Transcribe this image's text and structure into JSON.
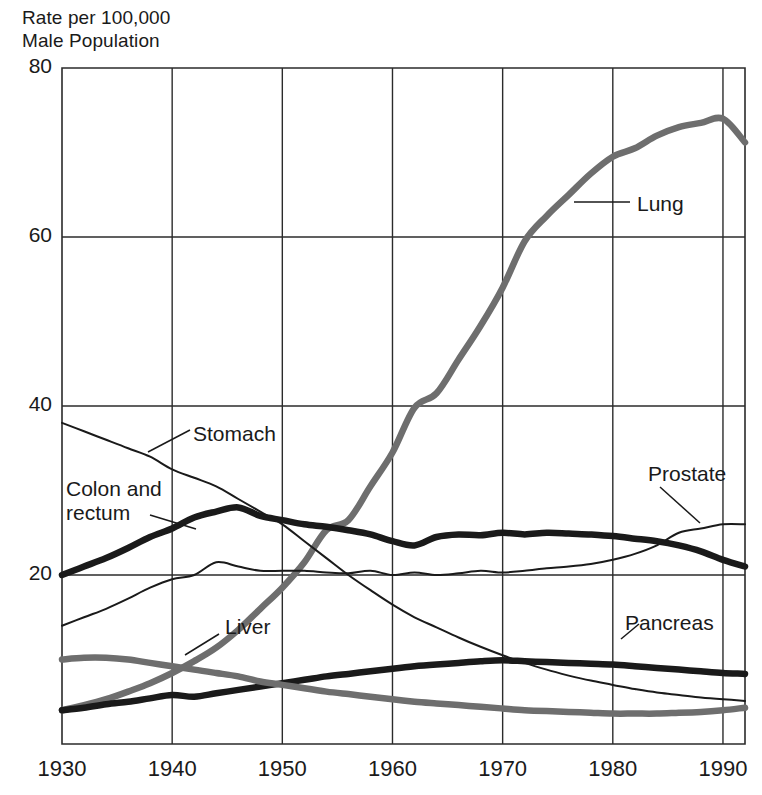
{
  "chart_data": {
    "type": "line",
    "title": "",
    "ylabel": "Rate per 100,000\nMale Population",
    "xlabel": "",
    "xlim": [
      1930,
      1992
    ],
    "ylim": [
      0,
      80
    ],
    "grid": true,
    "legend_position": "inline-labels",
    "yticks": [
      "80",
      "60",
      "40",
      "20"
    ],
    "ytick_values": [
      80,
      60,
      40,
      20
    ],
    "xticks": [
      "1930",
      "1940",
      "1950",
      "1960",
      "1970",
      "1980",
      "1990"
    ],
    "xtick_values": [
      1930,
      1940,
      1950,
      1960,
      1970,
      1980,
      1990
    ],
    "x": [
      1930,
      1932,
      1934,
      1936,
      1938,
      1940,
      1942,
      1944,
      1946,
      1948,
      1950,
      1952,
      1954,
      1956,
      1958,
      1960,
      1962,
      1964,
      1966,
      1968,
      1970,
      1972,
      1974,
      1976,
      1978,
      1980,
      1982,
      1984,
      1986,
      1988,
      1990,
      1992
    ],
    "series": [
      {
        "name": "Lung",
        "color": "#6e6e6e",
        "width": "thick",
        "label": "Lung",
        "values": [
          4.0,
          4.6,
          5.3,
          6.2,
          7.2,
          8.4,
          9.8,
          11.4,
          13.5,
          16.0,
          18.5,
          21.5,
          25.3,
          26.5,
          30.5,
          34.5,
          39.8,
          41.5,
          45.5,
          49.5,
          54.0,
          59.5,
          62.5,
          65.0,
          67.5,
          69.5,
          70.5,
          72.0,
          73.0,
          73.5,
          74.0,
          71.2
        ]
      },
      {
        "name": "Stomach",
        "color": "#1a1a1a",
        "width": "thin",
        "label": "Stomach",
        "values": [
          38.0,
          37.0,
          36.0,
          35.0,
          34.0,
          32.5,
          31.5,
          30.5,
          29.0,
          27.5,
          26.0,
          24.0,
          22.0,
          20.0,
          18.2,
          16.5,
          15.0,
          13.8,
          12.6,
          11.5,
          10.5,
          9.6,
          8.8,
          8.1,
          7.5,
          7.0,
          6.5,
          6.1,
          5.8,
          5.5,
          5.3,
          5.1
        ]
      },
      {
        "name": "Colon and rectum",
        "color": "#1a1a1a",
        "width": "thick",
        "label": "Colon and\nrectum",
        "values": [
          20.0,
          21.0,
          22.0,
          23.2,
          24.5,
          25.5,
          26.8,
          27.5,
          28.0,
          27.0,
          26.5,
          26.0,
          25.7,
          25.3,
          24.8,
          24.0,
          23.5,
          24.5,
          24.8,
          24.7,
          25.0,
          24.8,
          25.0,
          24.9,
          24.8,
          24.6,
          24.3,
          24.0,
          23.5,
          22.8,
          21.8,
          21.0
        ]
      },
      {
        "name": "Prostate",
        "color": "#1a1a1a",
        "width": "thin",
        "label": "Prostate",
        "values": [
          14.0,
          15.0,
          16.0,
          17.2,
          18.5,
          19.5,
          20.0,
          21.5,
          21.0,
          20.5,
          20.5,
          20.5,
          20.3,
          20.2,
          20.5,
          20.0,
          20.3,
          20.0,
          20.2,
          20.5,
          20.3,
          20.5,
          20.8,
          21.0,
          21.3,
          21.8,
          22.5,
          23.5,
          25.0,
          25.5,
          26.0,
          26.0
        ]
      },
      {
        "name": "Pancreas",
        "color": "#1a1a1a",
        "width": "thick",
        "label": "Pancreas",
        "values": [
          4.0,
          4.3,
          4.7,
          5.0,
          5.4,
          5.8,
          5.6,
          6.0,
          6.4,
          6.8,
          7.2,
          7.6,
          8.0,
          8.3,
          8.6,
          8.9,
          9.2,
          9.4,
          9.6,
          9.8,
          9.9,
          9.8,
          9.7,
          9.6,
          9.5,
          9.4,
          9.2,
          9.0,
          8.8,
          8.6,
          8.4,
          8.3
        ]
      },
      {
        "name": "Liver",
        "color": "#6e6e6e",
        "width": "thick",
        "label": "Liver",
        "values": [
          10.0,
          10.2,
          10.2,
          10.0,
          9.6,
          9.2,
          8.8,
          8.4,
          8.0,
          7.4,
          7.0,
          6.6,
          6.2,
          5.9,
          5.6,
          5.3,
          5.0,
          4.8,
          4.6,
          4.4,
          4.2,
          4.0,
          3.9,
          3.8,
          3.7,
          3.6,
          3.6,
          3.6,
          3.7,
          3.8,
          4.0,
          4.3
        ]
      }
    ],
    "annotations": [
      {
        "name": "lung-label",
        "text": "Lung",
        "x": 637,
        "y": 192,
        "leader": [
          [
            574,
            202
          ],
          [
            630,
            202
          ]
        ]
      },
      {
        "name": "stomach-label",
        "text": "Stomach",
        "x": 193,
        "y": 422,
        "leader": [
          [
            148,
            452
          ],
          [
            190,
            430
          ]
        ]
      },
      {
        "name": "colon-label",
        "text": "Colon and\nrectum",
        "x": 66,
        "y": 477,
        "leader": [
          [
            150,
            515
          ],
          [
            196,
            529
          ]
        ]
      },
      {
        "name": "prostate-label",
        "text": "Prostate",
        "x": 648,
        "y": 462,
        "leader": [
          [
            660,
            487
          ],
          [
            700,
            523
          ]
        ]
      },
      {
        "name": "pancreas-label",
        "text": "Pancreas",
        "x": 625,
        "y": 611,
        "leader": [
          [
            621,
            639
          ],
          [
            639,
            624
          ]
        ]
      },
      {
        "name": "liver-label",
        "text": "Liver",
        "x": 225,
        "y": 615,
        "leader": [
          [
            185,
            655
          ],
          [
            219,
            634
          ]
        ]
      }
    ]
  },
  "axis": {
    "title": "Rate per 100,000\nMale Population"
  }
}
